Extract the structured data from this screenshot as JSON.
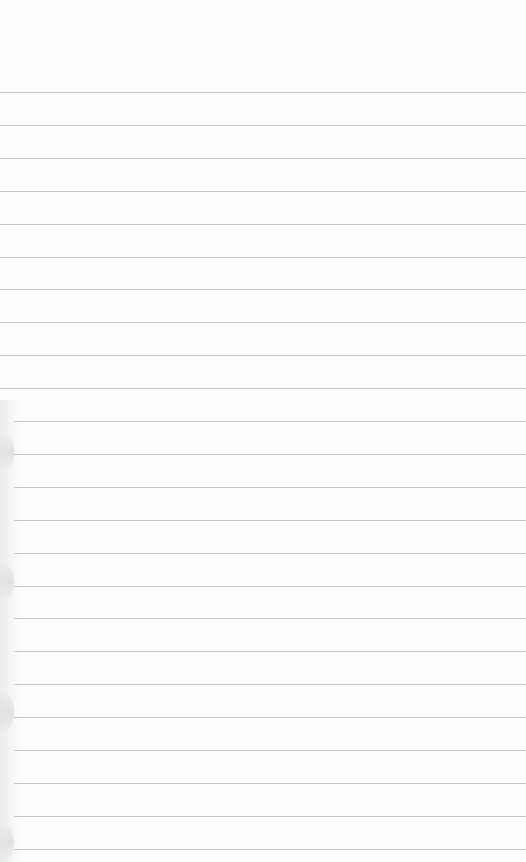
{
  "image": {
    "subject": "blank lined notebook paper",
    "background_color": "#fefefe",
    "rule_color": "#bdbdbd",
    "rule_count": 24,
    "first_rule_y": 92,
    "rule_spacing": 32.9
  }
}
